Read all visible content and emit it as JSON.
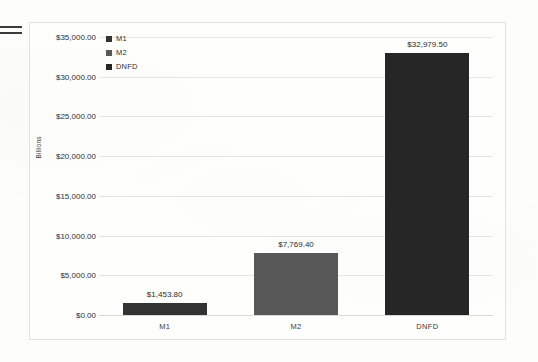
{
  "page": {
    "background_color": "#fdfdfb",
    "edge_mark_name": "page-edge-artifact"
  },
  "chart_frame": {
    "border_color": "#e2e2e2"
  },
  "legend": {
    "position": "top-left-inside-plot",
    "items": [
      {
        "label": "M1",
        "color": "#333333"
      },
      {
        "label": "M2",
        "color": "#585858"
      },
      {
        "label": "DNFD",
        "color": "#262626"
      }
    ]
  },
  "chart_data": {
    "type": "bar",
    "title": "",
    "xlabel": "",
    "ylabel": "Billions",
    "categories": [
      "M1",
      "M2",
      "DNFD"
    ],
    "values": [
      1453.8,
      7769.4,
      32979.5
    ],
    "data_labels": [
      "$1,453.80",
      "$7,769.40",
      "$32,979.50"
    ],
    "bar_colors": [
      "#333333",
      "#585858",
      "#262626"
    ],
    "ylim": [
      0,
      35000
    ],
    "ytick_values": [
      0,
      5000,
      10000,
      15000,
      20000,
      25000,
      30000,
      35000
    ],
    "ytick_labels": [
      "$0.00",
      "$5,000.00",
      "$10,000.00",
      "$15,000.00",
      "$20,000.00",
      "$25,000.00",
      "$30,000.00",
      "$35,000.00"
    ],
    "grid": true,
    "legend": [
      "M1",
      "M2",
      "DNFD"
    ],
    "legend_position": "upper left"
  }
}
